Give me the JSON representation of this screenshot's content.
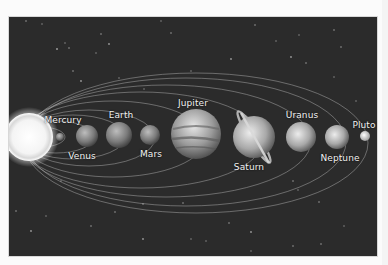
{
  "diagram": {
    "background_color": "#2b2b2b",
    "page_color": "#fbfbfb",
    "sun": {
      "label": "",
      "cx": 28,
      "cy": 136,
      "r": 24
    },
    "planets": [
      {
        "name": "Mercury",
        "cx": 59,
        "cy": 136,
        "r": 4,
        "label_x": 62,
        "label_y": 114
      },
      {
        "name": "Venus",
        "cx": 86,
        "cy": 135,
        "r": 11,
        "label_x": 81,
        "label_y": 150
      },
      {
        "name": "Earth",
        "cx": 118,
        "cy": 134,
        "r": 13,
        "label_x": 120,
        "label_y": 109
      },
      {
        "name": "Mars",
        "cx": 149,
        "cy": 134,
        "r": 10,
        "label_x": 150,
        "label_y": 148
      },
      {
        "name": "Jupiter",
        "cx": 195,
        "cy": 133,
        "r": 25,
        "label_x": 192,
        "label_y": 97
      },
      {
        "name": "Saturn",
        "cx": 253,
        "cy": 136,
        "r": 21,
        "label_x": 248,
        "label_y": 161
      },
      {
        "name": "Uranus",
        "cx": 300,
        "cy": 136,
        "r": 15,
        "label_x": 301,
        "label_y": 109
      },
      {
        "name": "Neptune",
        "cx": 336,
        "cy": 136,
        "r": 12,
        "label_x": 339,
        "label_y": 152
      },
      {
        "name": "Pluto",
        "cx": 364,
        "cy": 135,
        "r": 5,
        "label_x": 363,
        "label_y": 119
      }
    ],
    "labels": {
      "mercury": "Mercury",
      "venus": "Venus",
      "earth": "Earth",
      "mars": "Mars",
      "jupiter": "Jupiter",
      "saturn": "Saturn",
      "uranus": "Uranus",
      "neptune": "Neptune",
      "pluto": "Pluto"
    }
  }
}
